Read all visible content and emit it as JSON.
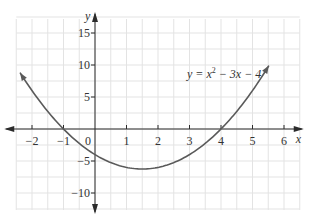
{
  "chart_data": {
    "type": "line",
    "title": "",
    "function": "x^2 - 3x - 4",
    "coefficients": {
      "a": 1,
      "b": -3,
      "c": -4
    },
    "equation_label": {
      "prefix": "y = x",
      "exp": "2",
      "suffix": " − 3x − 4"
    },
    "xlabel": "x",
    "ylabel": "y",
    "xlim": [
      -2.5,
      6.5
    ],
    "ylim": [
      -12.5,
      17.5
    ],
    "plotted_x_range": [
      -2.38,
      5.52
    ],
    "x_ticks": [
      -2,
      -1,
      1,
      2,
      3,
      4,
      5,
      6
    ],
    "x_tick_labels": [
      "−2",
      "−1",
      "1",
      "2",
      "3",
      "4",
      "5",
      "6"
    ],
    "y_ticks": [
      15,
      10,
      5,
      -5,
      -10
    ],
    "y_tick_labels": [
      "15",
      "10",
      "5",
      "−5",
      "−10"
    ],
    "origin_label": "0",
    "grid": true,
    "grid_step_x": 0.5,
    "grid_step_y": 2.5,
    "key_points": [
      {
        "label": "x-intercept",
        "x": -1,
        "y": 0
      },
      {
        "label": "x-intercept",
        "x": 4,
        "y": 0
      },
      {
        "label": "y-intercept",
        "x": 0,
        "y": -4
      },
      {
        "label": "vertex",
        "x": 1.5,
        "y": -6.25
      }
    ],
    "colors": {
      "curve": "#5a5a5a",
      "axis": "#2b2b2b",
      "grid": "#e3e3e3"
    }
  }
}
